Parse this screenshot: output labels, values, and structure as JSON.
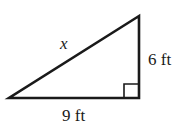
{
  "diagram": {
    "type": "right-triangle",
    "hypotenuse_label": "x",
    "vertical_leg_label": "6 ft",
    "horizontal_leg_label": "9 ft",
    "right_angle_marker": true,
    "stroke_color": "#1a1a1a"
  }
}
